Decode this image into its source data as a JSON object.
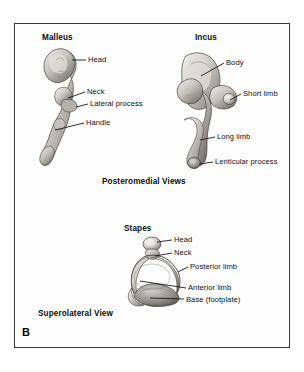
{
  "figure": {
    "panel_letter": "B",
    "frame_color": "#3a3a3a",
    "background_color": "#ffffff",
    "bone_color_light": "#e8e6e2",
    "bone_color_mid": "#b8b5b0",
    "bone_color_dark": "#6e6b66",
    "label_color": "#111111"
  },
  "panels": {
    "malleus": {
      "title": "Malleus",
      "labels": [
        {
          "text": "Head"
        },
        {
          "text": "Neck"
        },
        {
          "text": "Lateral process"
        },
        {
          "text": "Handle"
        }
      ]
    },
    "incus": {
      "title": "Incus",
      "labels": [
        {
          "text": "Body"
        },
        {
          "text": "Short limb"
        },
        {
          "text": "Long limb"
        },
        {
          "text": "Lenticular process"
        }
      ]
    },
    "stapes": {
      "title": "Stapes",
      "labels": [
        {
          "text": "Head"
        },
        {
          "text": "Neck"
        },
        {
          "text": "Posterior limb"
        },
        {
          "text": "Anterior limb"
        },
        {
          "text": "Base (footplate)"
        }
      ]
    }
  },
  "captions": {
    "top_view": "Posteromedial Views",
    "bottom_view": "Superolateral View"
  }
}
